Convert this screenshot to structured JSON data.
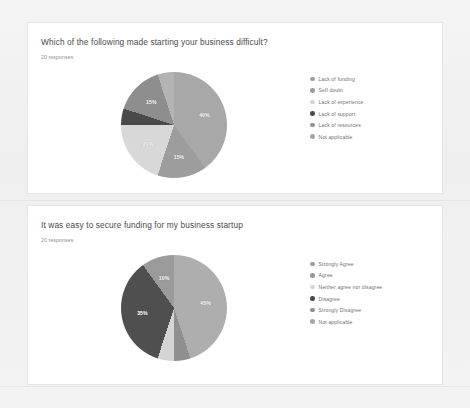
{
  "page": {
    "background_color": "#f2f2f2",
    "card_background": "#ffffff"
  },
  "cards": [
    {
      "title": "Which of the following made starting your business difficult?",
      "responses": "20 responses"
    },
    {
      "title": "It was easy to secure funding for my business startup",
      "responses": "20 responses"
    }
  ],
  "chart_data": [
    {
      "type": "pie",
      "title": "Which of the following made starting your business difficult?",
      "subtitle": "20 responses",
      "legend_position": "right",
      "categories": [
        "Lack of funding",
        "Self doubt",
        "Lack of experience",
        "Lack of support",
        "Lack of resources",
        "Not applicable"
      ],
      "values": [
        40,
        15,
        20,
        5,
        15,
        5
      ],
      "labels": [
        "40%",
        "15%",
        "20%",
        "",
        "15%",
        ""
      ],
      "colors": [
        "#a8a8a8",
        "#9d9d9d",
        "#d8d8d8",
        "#4a4a4a",
        "#8e8e8e",
        "#b4b4b4"
      ],
      "legend_colors": [
        "#a0a0a0",
        "#9a9a9a",
        "#d5d5d5",
        "#4a4a4a",
        "#909090",
        "#a6a6a6"
      ]
    },
    {
      "type": "pie",
      "title": "It was easy to secure funding for my business startup",
      "subtitle": "20 responses",
      "legend_position": "right",
      "categories": [
        "Strongly Agree",
        "Agree",
        "Neither agree nor disagree",
        "Disagree",
        "Strongly Disagree",
        "Not applicable"
      ],
      "values": [
        45,
        5,
        5,
        35,
        10,
        0
      ],
      "labels": [
        "45%",
        "",
        "",
        "35%",
        "10%",
        ""
      ],
      "colors": [
        "#aeaeae",
        "#8f8f8f",
        "#d4d4d4",
        "#4f4f4f",
        "#9b9b9b",
        "#bdbdbd"
      ],
      "legend_colors": [
        "#9e9e9e",
        "#989898",
        "#d5d5d5",
        "#4a4a4a",
        "#8e8e8e",
        "#a4a4a4"
      ]
    }
  ]
}
